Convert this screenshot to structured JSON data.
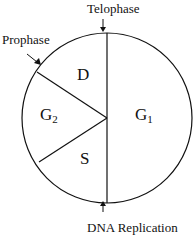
{
  "diagram": {
    "type": "cell-cycle-circle",
    "segments": [
      {
        "id": "G1",
        "label": "G",
        "sub": "1"
      },
      {
        "id": "G2",
        "label": "G",
        "sub": "2"
      },
      {
        "id": "D",
        "label": "D",
        "sub": ""
      },
      {
        "id": "S",
        "label": "S",
        "sub": ""
      }
    ],
    "annotations": {
      "telophase": "Telophase",
      "prophase": "Prophase",
      "dna_replication": "DNA Replication"
    }
  }
}
